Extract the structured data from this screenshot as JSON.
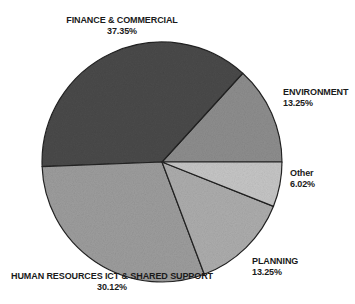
{
  "chart_data": {
    "type": "pie",
    "title": "",
    "subtitle": "",
    "xlabel": "",
    "ylabel": "",
    "legend_position": "none",
    "grid": false,
    "units": "percent",
    "start_angle_deg": 0,
    "direction": "counterclockwise",
    "categories": [
      "ENVIRONMENT",
      "FINANCE & COMMERCIAL",
      "HUMAN RESOURCES ICT & SHARED SUPPORT",
      "PLANNING",
      "Other"
    ],
    "values": [
      13.25,
      37.35,
      30.12,
      13.25,
      6.02
    ],
    "slices": [
      {
        "label": "ENVIRONMENT",
        "percent_text": "13.25%",
        "value": 13.25,
        "color": "#8e8e8e",
        "label_position": "right-upper"
      },
      {
        "label": "FINANCE & COMMERCIAL",
        "percent_text": "37.35%",
        "value": 37.35,
        "color": "#4a4a4a",
        "label_position": "top"
      },
      {
        "label": "HUMAN RESOURCES ICT & SHARED SUPPORT",
        "percent_text": "30.12%",
        "value": 30.12,
        "color": "#9d9d9d",
        "label_position": "bottom-left"
      },
      {
        "label": "PLANNING",
        "percent_text": "13.25%",
        "value": 13.25,
        "color": "#adadad",
        "label_position": "bottom-right"
      },
      {
        "label": "Other",
        "percent_text": "6.02%",
        "value": 6.02,
        "color": "#c6c6c6",
        "label_position": "right-lower"
      }
    ],
    "geometry": {
      "center_x": 162,
      "center_y": 162,
      "radius": 120,
      "stroke_color": "#222222",
      "stroke_width": 1.2
    }
  },
  "labels": {
    "finance": {
      "name": "FINANCE & COMMERCIAL",
      "percent": "37.35%"
    },
    "environment": {
      "name": "ENVIRONMENT",
      "percent": "13.25%"
    },
    "other": {
      "name": "Other",
      "percent": "6.02%"
    },
    "planning": {
      "name": "PLANNING",
      "percent": "13.25%"
    },
    "hr": {
      "name": "HUMAN RESOURCES ICT & SHARED SUPPORT",
      "percent": "30.12%"
    }
  }
}
